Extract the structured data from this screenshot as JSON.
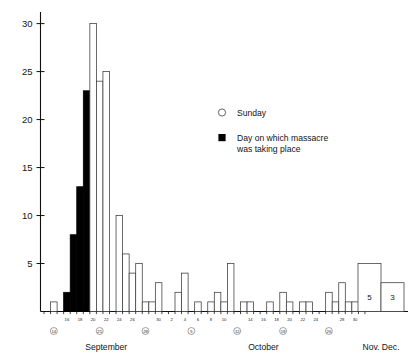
{
  "chart_data": {
    "type": "bar",
    "title": "",
    "subtitle": "",
    "xlabel": "",
    "ylabel": "",
    "ylim": [
      0,
      31
    ],
    "yticks": [
      5,
      10,
      15,
      20,
      25,
      30
    ],
    "ytick_labels": [
      "5",
      "10",
      "15",
      "20",
      "25",
      "30"
    ],
    "grid": false,
    "legend_position": "center-right",
    "legend": [
      {
        "key": "sunday",
        "marker": "open-circle",
        "label": "Sunday"
      },
      {
        "key": "massacre",
        "marker": "filled-square",
        "label": "Day on which massacre was taking place",
        "label_line1": "Day on which massacre",
        "label_line2": "was taking place"
      }
    ],
    "month_groups": [
      {
        "name": "September",
        "label": "September"
      },
      {
        "name": "October",
        "label": "October"
      },
      {
        "name": "NovDec",
        "label": "Nov. Dec."
      }
    ],
    "axis_tick_labels_september": [
      "16",
      "18",
      "20",
      "22",
      "24",
      "26",
      "30"
    ],
    "axis_tick_labels_october": [
      "2",
      "4",
      "6",
      "8",
      "10",
      "14",
      "16",
      "18",
      "20",
      "22",
      "24",
      "28",
      "30"
    ],
    "sunday_marked_days": [
      "14",
      "21",
      "28",
      "5",
      "12",
      "19",
      "26"
    ],
    "categories": [
      "Sep 13",
      "Sep 14",
      "Sep 15",
      "Sep 16",
      "Sep 17",
      "Sep 18",
      "Sep 19",
      "Sep 20",
      "Sep 21",
      "Sep 22",
      "Sep 23",
      "Sep 24",
      "Sep 25",
      "Sep 26",
      "Sep 27",
      "Sep 28",
      "Sep 29",
      "Sep 30",
      "Oct 1",
      "Oct 2",
      "Oct 3",
      "Oct 4",
      "Oct 5",
      "Oct 6",
      "Oct 7",
      "Oct 8",
      "Oct 9",
      "Oct 10",
      "Oct 11",
      "Oct 12",
      "Oct 13",
      "Oct 14",
      "Oct 15",
      "Oct 16",
      "Oct 17",
      "Oct 18",
      "Oct 19",
      "Oct 20",
      "Oct 21",
      "Oct 22",
      "Oct 23",
      "Oct 24",
      "Oct 25",
      "Oct 26",
      "Oct 27",
      "Oct 28",
      "Oct 29",
      "Oct 30",
      "Oct 31",
      "Nov",
      "Dec"
    ],
    "values": [
      0,
      1,
      0,
      2,
      8,
      13,
      23,
      30,
      24,
      25,
      10,
      6,
      4,
      5,
      1,
      1,
      3,
      0,
      2,
      4,
      0,
      1,
      0,
      1,
      2,
      1,
      5,
      1,
      1,
      0,
      1,
      0,
      1,
      2,
      1,
      0,
      1,
      1,
      1,
      0,
      2,
      1,
      3,
      1,
      1,
      0,
      0,
      0,
      0,
      5,
      3
    ],
    "filled": [
      false,
      false,
      false,
      true,
      true,
      true,
      true,
      false,
      false,
      false,
      false,
      false,
      false,
      false,
      false,
      false,
      false,
      false,
      false,
      false,
      false,
      false,
      false,
      false,
      false,
      false,
      false,
      false,
      false,
      false,
      false,
      false,
      false,
      false,
      false,
      false,
      false,
      false,
      false,
      false,
      false,
      false,
      false,
      false,
      false,
      false,
      false,
      false,
      false,
      false,
      false
    ],
    "bars": [
      {
        "day": "14",
        "value": 1,
        "filled": false,
        "month": "September"
      },
      {
        "day": "16",
        "value": 2,
        "filled": true,
        "month": "September"
      },
      {
        "day": "17",
        "value": 8,
        "filled": true,
        "month": "September"
      },
      {
        "day": "18",
        "value": 13,
        "filled": true,
        "month": "September"
      },
      {
        "day": "19",
        "value": 23,
        "filled": true,
        "month": "September"
      },
      {
        "day": "20",
        "value": 30,
        "filled": false,
        "month": "September"
      },
      {
        "day": "21",
        "value": 24,
        "filled": false,
        "month": "September"
      },
      {
        "day": "22",
        "value": 25,
        "filled": false,
        "month": "September"
      },
      {
        "day": "24",
        "value": 10,
        "filled": false,
        "month": "September"
      },
      {
        "day": "25",
        "value": 6,
        "filled": false,
        "month": "September"
      },
      {
        "day": "26",
        "value": 4,
        "filled": false,
        "month": "September"
      },
      {
        "day": "27",
        "value": 5,
        "filled": false,
        "month": "September"
      },
      {
        "day": "28",
        "value": 1,
        "filled": false,
        "month": "September"
      },
      {
        "day": "29",
        "value": 1,
        "filled": false,
        "month": "September"
      },
      {
        "day": "30",
        "value": 3,
        "filled": false,
        "month": "September"
      },
      {
        "day": "3",
        "value": 2,
        "filled": false,
        "month": "October"
      },
      {
        "day": "4",
        "value": 4,
        "filled": false,
        "month": "October"
      },
      {
        "day": "6",
        "value": 1,
        "filled": false,
        "month": "October"
      },
      {
        "day": "8",
        "value": 1,
        "filled": false,
        "month": "October"
      },
      {
        "day": "9",
        "value": 2,
        "filled": false,
        "month": "October"
      },
      {
        "day": "10",
        "value": 1,
        "filled": false,
        "month": "October"
      },
      {
        "day": "11",
        "value": 5,
        "filled": false,
        "month": "October"
      },
      {
        "day": "13",
        "value": 1,
        "filled": false,
        "month": "October"
      },
      {
        "day": "14",
        "value": 1,
        "filled": false,
        "month": "October"
      },
      {
        "day": "17",
        "value": 1,
        "filled": false,
        "month": "October"
      },
      {
        "day": "19",
        "value": 2,
        "filled": false,
        "month": "October"
      },
      {
        "day": "20",
        "value": 1,
        "filled": false,
        "month": "October"
      },
      {
        "day": "22",
        "value": 1,
        "filled": false,
        "month": "October"
      },
      {
        "day": "23",
        "value": 1,
        "filled": false,
        "month": "October"
      },
      {
        "day": "26",
        "value": 2,
        "filled": false,
        "month": "October"
      },
      {
        "day": "27",
        "value": 1,
        "filled": false,
        "month": "October"
      },
      {
        "day": "28",
        "value": 3,
        "filled": false,
        "month": "October"
      },
      {
        "day": "29",
        "value": 1,
        "filled": false,
        "month": "October"
      },
      {
        "day": "30",
        "value": 1,
        "filled": false,
        "month": "October"
      },
      {
        "day": "Nov",
        "value": 5,
        "filled": false,
        "month": "NovDec",
        "value_label": "5"
      },
      {
        "day": "Dec",
        "value": 3,
        "filled": false,
        "month": "NovDec",
        "value_label": "3"
      }
    ]
  }
}
